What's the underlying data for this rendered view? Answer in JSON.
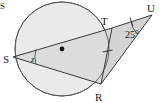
{
  "figure": {
    "kind": "circle-tangent-geometry-diagram",
    "background_color": "#ffffff",
    "stroke_color": "#3a3a3a",
    "circle_fill": "#eaeaea",
    "region_fill_quad": "#dcdcdc",
    "region_fill_triangle": "#d2d2d2",
    "corner_artifact": "S"
  },
  "points": {
    "s": {
      "label": "S",
      "x": 13,
      "y": 57,
      "label_x": 4,
      "label_y": 62
    },
    "t": {
      "label": "T",
      "x": 112,
      "y": 28,
      "label_x": 106,
      "label_y": 24
    },
    "r": {
      "label": "R",
      "x": 101,
      "y": 84,
      "label_x": 97,
      "label_y": 100
    },
    "u": {
      "label": "U",
      "x": 152,
      "y": 15,
      "label_x": 150,
      "label_y": 12
    },
    "center": {
      "label": "",
      "x": 62,
      "y": 49
    }
  },
  "circle": {
    "cx": 62,
    "cy": 49,
    "r": 47
  },
  "angles": {
    "at_s": {
      "label": "z",
      "label_x": 33,
      "label_y": 62
    },
    "at_u": {
      "label": "25°",
      "label_x": 126,
      "label_y": 37
    }
  },
  "tick_marks": {
    "count": 2,
    "on_segments": [
      "TR",
      "TU"
    ]
  },
  "segments": [
    {
      "name": "ST",
      "from": "s",
      "to": "t"
    },
    {
      "name": "SR",
      "from": "s",
      "to": "r"
    },
    {
      "name": "TR",
      "from": "t",
      "to": "r"
    },
    {
      "name": "TU",
      "from": "t",
      "to": "u"
    },
    {
      "name": "RU",
      "from": "r",
      "to": "u"
    }
  ]
}
